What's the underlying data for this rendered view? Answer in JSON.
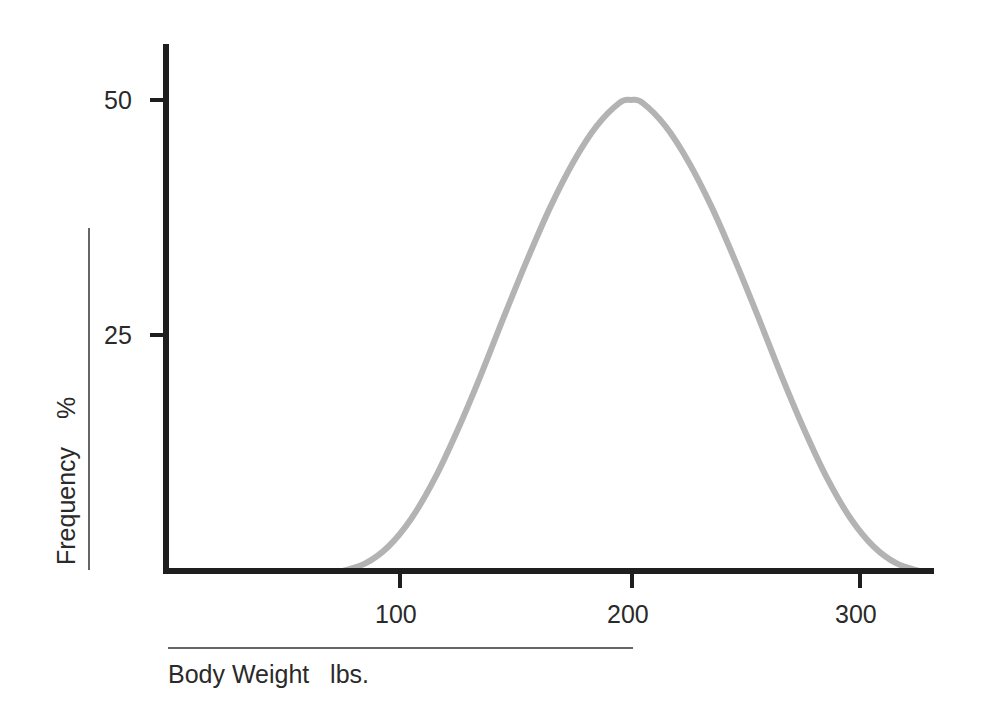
{
  "chart_data": {
    "type": "line",
    "title": "",
    "xlabel": "Body Weight   lbs.",
    "ylabel": "Frequency    %",
    "x_ticks": [
      100,
      200,
      300
    ],
    "y_ticks": [
      25,
      50
    ],
    "x_tick_labels": [
      "100",
      "200",
      "300"
    ],
    "y_tick_labels": [
      "25",
      "50"
    ],
    "xlim": [
      0,
      333
    ],
    "ylim": [
      0,
      56
    ],
    "grid": false,
    "legend": null,
    "series": [
      {
        "name": "Body weight distribution",
        "color": "#b3b3b3",
        "x": [
          75,
          85,
          95,
          105,
          115,
          125,
          135,
          145,
          155,
          165,
          175,
          185,
          195,
          200,
          205,
          215,
          225,
          235,
          245,
          255,
          265,
          275,
          285,
          295,
          305,
          315,
          325
        ],
        "y": [
          0,
          0.8,
          2.6,
          5.6,
          9.8,
          15.0,
          20.8,
          27.0,
          33.0,
          38.6,
          43.4,
          47.2,
          49.7,
          50,
          49.7,
          47.2,
          43.4,
          38.6,
          33.0,
          27.0,
          20.8,
          15.0,
          9.8,
          5.6,
          2.6,
          0.8,
          0
        ]
      }
    ]
  },
  "labels": {
    "y_axis": "Frequency    %",
    "x_axis": "Body Weight   lbs.",
    "y_ticks": [
      "50",
      "25"
    ],
    "x_ticks": [
      "100",
      "200",
      "300"
    ]
  }
}
